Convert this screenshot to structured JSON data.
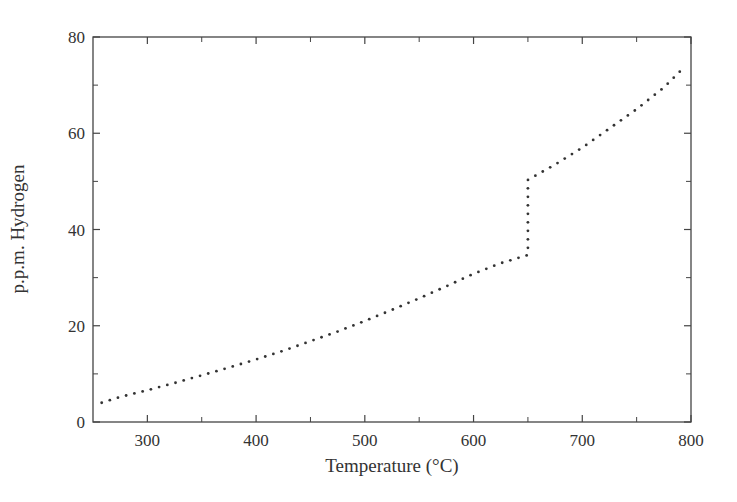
{
  "chart_data": {
    "type": "scatter",
    "title": "",
    "xlabel": "Temperature (°C)",
    "ylabel": "p.p.m. Hydrogen",
    "xlim": [
      250,
      800
    ],
    "ylim": [
      0,
      80
    ],
    "x_ticks_major": [
      300,
      400,
      500,
      600,
      700,
      800
    ],
    "x_ticks_minor": [
      350,
      450,
      550,
      650,
      750
    ],
    "y_ticks_major": [
      0,
      20,
      40,
      60,
      80
    ],
    "y_ticks_minor": [
      10,
      30,
      50,
      70
    ],
    "grid": false,
    "legend": null,
    "marker_style": "dotted",
    "series": [
      {
        "name": "Hydrogen solubility",
        "points": [
          [
            258,
            4.0
          ],
          [
            275,
            5.2
          ],
          [
            300,
            6.6
          ],
          [
            325,
            8.1
          ],
          [
            350,
            9.7
          ],
          [
            375,
            11.3
          ],
          [
            400,
            13.0
          ],
          [
            425,
            14.8
          ],
          [
            450,
            16.8
          ],
          [
            475,
            18.8
          ],
          [
            500,
            21.0
          ],
          [
            525,
            23.3
          ],
          [
            550,
            25.7
          ],
          [
            575,
            28.2
          ],
          [
            600,
            30.8
          ],
          [
            625,
            33.0
          ],
          [
            650,
            34.7
          ],
          [
            650,
            37.0
          ],
          [
            650,
            40.0
          ],
          [
            650,
            43.0
          ],
          [
            650,
            46.0
          ],
          [
            650,
            50.3
          ],
          [
            675,
            53.5
          ],
          [
            700,
            57.0
          ],
          [
            725,
            61.0
          ],
          [
            750,
            65.0
          ],
          [
            775,
            69.5
          ],
          [
            795,
            74.0
          ]
        ]
      }
    ]
  },
  "axes": {
    "x_label": "Temperature (°C)",
    "y_label": "p.p.m. Hydrogen",
    "x_tick_labels": [
      "300",
      "400",
      "500",
      "600",
      "700",
      "800"
    ],
    "y_tick_labels": [
      "0",
      "20",
      "40",
      "60",
      "80"
    ]
  }
}
